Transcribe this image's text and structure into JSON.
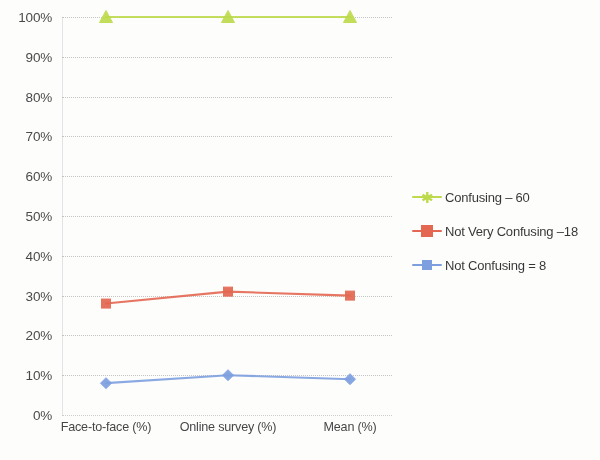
{
  "chart_data": {
    "type": "line",
    "title": "",
    "subtitle": "",
    "xlabel": "",
    "ylabel": "",
    "categories": [
      "Face-to-face (%)",
      "Online survey (%)",
      "Mean (%)"
    ],
    "series": [
      {
        "name": "Confusing",
        "legend_label": "Confusing – 60",
        "count": 60,
        "color": "#bcd94a",
        "marker": "triangle",
        "values": [
          100,
          100,
          100
        ]
      },
      {
        "name": "Not Very Confusing",
        "legend_label": "Not Very Confusing –18",
        "count": 18,
        "color": "#e2654f",
        "marker": "square",
        "values": [
          28,
          31,
          30
        ]
      },
      {
        "name": "Not Confusing",
        "legend_label": "Not Confusing  = 8",
        "count": 8,
        "color": "#7c9ede",
        "marker": "diamond",
        "values": [
          8,
          10,
          9
        ]
      }
    ],
    "ylim": [
      0,
      100
    ],
    "y_ticks": [
      0,
      10,
      20,
      30,
      40,
      50,
      60,
      70,
      80,
      90,
      100
    ],
    "y_tick_labels": [
      "0%",
      "10%",
      "20%",
      "30%",
      "40%",
      "50%",
      "60%",
      "70%",
      "80%",
      "90%",
      "100%"
    ],
    "grid": true,
    "grid_style": "dotted-horizontal",
    "legend_position": "right"
  },
  "axes": {
    "y_labels": [
      "100%",
      "90%",
      "80%",
      "70%",
      "60%",
      "50%",
      "40%",
      "30%",
      "20%",
      "10%",
      "0%"
    ],
    "x_labels": [
      "Face-to-face (%)",
      "Online survey (%)",
      "Mean (%)"
    ]
  },
  "legend": {
    "items": [
      {
        "label": "Confusing – 60",
        "color": "#bcd94a",
        "marker": "star-icon"
      },
      {
        "label": "Not Very Confusing –18",
        "color": "#e2654f",
        "marker": "square-icon"
      },
      {
        "label": "Not Confusing  = 8",
        "color": "#7c9ede",
        "marker": "diamond-icon"
      }
    ]
  },
  "colors": {
    "series_confusing": "#bcd94a",
    "series_not_very_confusing": "#e2654f",
    "series_not_confusing": "#7c9ede",
    "gridline": "#b9b9b9",
    "text": "#2a2a2a",
    "background": "#ffffff"
  }
}
